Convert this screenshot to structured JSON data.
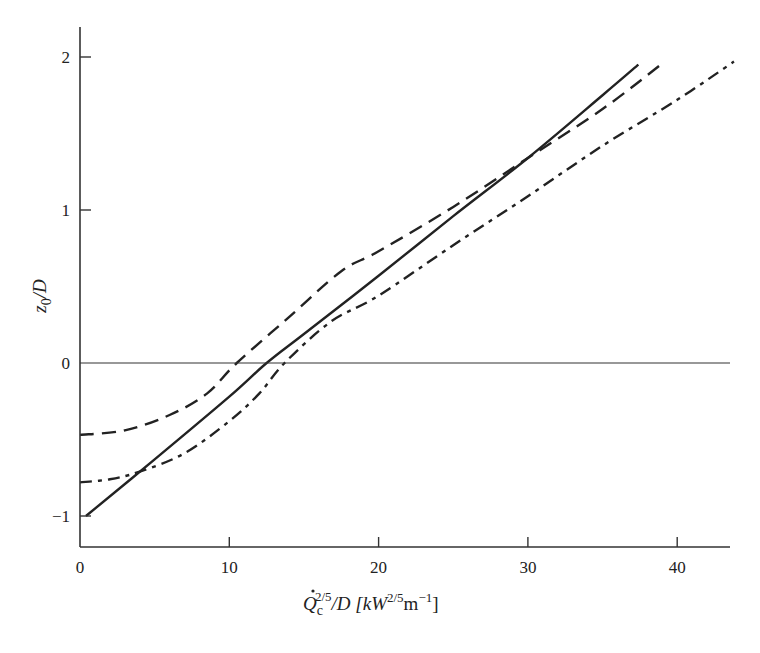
{
  "chart_data": {
    "type": "line",
    "title": "",
    "xlabel": "Q̇c^(2/5)/D [kW^(2/5) m^-1]",
    "ylabel": "z0/D",
    "xlim": [
      0,
      43.5
    ],
    "ylim": [
      -1.22,
      2.2
    ],
    "x_ticks": [
      0,
      10,
      20,
      30,
      40
    ],
    "y_ticks": [
      -1,
      0,
      1,
      2
    ],
    "grid": false,
    "reference_lines": [
      {
        "axis": "y",
        "value": 0
      }
    ],
    "legend": null,
    "series": [
      {
        "name": "solid",
        "style": "solid",
        "points": [
          [
            0.4,
            -1.0
          ],
          [
            5,
            -0.63
          ],
          [
            10,
            -0.22
          ],
          [
            12.5,
            0.0
          ],
          [
            15,
            0.19
          ],
          [
            20,
            0.57
          ],
          [
            25,
            0.96
          ],
          [
            30,
            1.34
          ],
          [
            35,
            1.75
          ],
          [
            37.4,
            1.95
          ]
        ]
      },
      {
        "name": "dashed",
        "style": "dashed",
        "points": [
          [
            0,
            -0.47
          ],
          [
            3,
            -0.44
          ],
          [
            6,
            -0.34
          ],
          [
            8.5,
            -0.2
          ],
          [
            10.5,
            0.0
          ],
          [
            14,
            0.3
          ],
          [
            17.5,
            0.6
          ],
          [
            20,
            0.73
          ],
          [
            25,
            1.02
          ],
          [
            30,
            1.34
          ],
          [
            35,
            1.66
          ],
          [
            38.9,
            1.95
          ]
        ]
      },
      {
        "name": "dash-dot",
        "style": "dashdot",
        "points": [
          [
            0,
            -0.78
          ],
          [
            2,
            -0.76
          ],
          [
            4,
            -0.71
          ],
          [
            7,
            -0.59
          ],
          [
            10,
            -0.38
          ],
          [
            12,
            -0.2
          ],
          [
            13.7,
            0.0
          ],
          [
            16.8,
            0.27
          ],
          [
            20,
            0.44
          ],
          [
            25,
            0.77
          ],
          [
            30,
            1.09
          ],
          [
            35,
            1.42
          ],
          [
            40,
            1.72
          ],
          [
            43.8,
            1.97
          ]
        ]
      }
    ]
  },
  "axes": {
    "x_tick_labels": [
      "0",
      "10",
      "20",
      "30",
      "40"
    ],
    "y_tick_labels": [
      "−1",
      "0",
      "1",
      "2"
    ],
    "x_title": {
      "base": "Q",
      "sub": "c",
      "sup": "2/5",
      "rest": "/D  [kW",
      "unit_sup": "2/5",
      "unit_mid": "m",
      "unit_sup2": "−1",
      "close": "]"
    },
    "y_title": {
      "base": "z",
      "sub": "0",
      "rest": "/D"
    }
  }
}
